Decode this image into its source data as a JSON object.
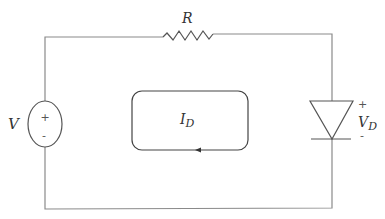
{
  "diagram": {
    "type": "circuit",
    "components": {
      "source": {
        "label": "V",
        "plus": "+",
        "minus": "-"
      },
      "resistor": {
        "label": "R"
      },
      "diode": {
        "voltage_label": "V",
        "voltage_subscript": "D",
        "plus": "+",
        "minus": "-"
      },
      "loop_current": {
        "label": "I",
        "subscript": "D",
        "direction": "counterclockwise"
      }
    },
    "colors": {
      "wire": "#8a8a8a",
      "component": "#555555",
      "text": "#333333",
      "background": "#ffffff"
    }
  }
}
